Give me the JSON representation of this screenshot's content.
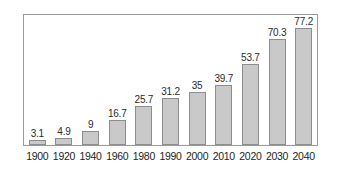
{
  "chart_data": {
    "type": "bar",
    "title": "",
    "subtitle": "",
    "xlabel": "",
    "ylabel": "",
    "categories": [
      "1900",
      "1920",
      "1940",
      "1960",
      "1980",
      "1990",
      "2000",
      "2010",
      "2020",
      "2030",
      "2040"
    ],
    "values": [
      3.1,
      4.9,
      9,
      16.7,
      25.7,
      31.2,
      35,
      39.7,
      53.7,
      70.3,
      77.2
    ],
    "value_labels": [
      "3.1",
      "4.9",
      "9",
      "16.7",
      "25.7",
      "31.2",
      "35",
      "39.7",
      "53.7",
      "70.3",
      "77.2"
    ],
    "ylim": [
      0,
      86
    ],
    "grid": false,
    "legend": null,
    "annotations": [],
    "bar_fill_color": "#c9c9c9",
    "bar_border_color": "#8d8d8d",
    "frame_color": "#9a9a9a",
    "label_color": "#2b2b2b",
    "tick_color": "#1d1d1d",
    "background_color": "#ffffff"
  }
}
